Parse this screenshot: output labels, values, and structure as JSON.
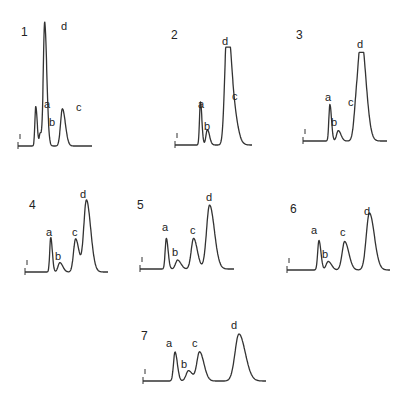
{
  "chart_data": [
    {
      "type": "line",
      "panel": "1",
      "peaks": [
        {
          "label": "a",
          "position": 0.24,
          "height": 0.32,
          "width": 0.012
        },
        {
          "label": "b",
          "position": 0.3,
          "height": 0.1,
          "width": 0.012
        },
        {
          "label": "d",
          "position": 0.36,
          "height": 1.0,
          "width": 0.018
        },
        {
          "label": "c",
          "position": 0.6,
          "height": 0.3,
          "width": 0.025
        }
      ],
      "x0": 18,
      "x1": 92,
      "baseline_y": 146,
      "top_y": 22,
      "number_pos": [
        21,
        36
      ],
      "label_pos": {
        "a": [
          44,
          108
        ],
        "b": [
          49,
          126
        ],
        "d": [
          61,
          30
        ],
        "c": [
          76,
          111
        ]
      }
    },
    {
      "type": "line",
      "panel": "2",
      "peaks": [
        {
          "label": "a",
          "position": 0.33,
          "height": 0.45,
          "width": 0.012
        },
        {
          "label": "b",
          "position": 0.42,
          "height": 0.16,
          "width": 0.018
        },
        {
          "label": "d",
          "position": 0.67,
          "height": 1.0,
          "width": 0.028
        },
        {
          "label": "c",
          "position": 0.73,
          "height": 0.5,
          "width": 0.04
        }
      ],
      "x0": 175,
      "x1": 252,
      "baseline_y": 145,
      "top_y": 49,
      "number_pos": [
        171,
        39
      ],
      "label_pos": {
        "a": [
          198,
          108
        ],
        "b": [
          204,
          130
        ],
        "d": [
          222,
          45
        ],
        "c": [
          232,
          100
        ]
      }
    },
    {
      "type": "line",
      "panel": "3",
      "peaks": [
        {
          "label": "a",
          "position": 0.32,
          "height": 0.42,
          "width": 0.012
        },
        {
          "label": "b",
          "position": 0.42,
          "height": 0.12,
          "width": 0.02
        },
        {
          "label": "c",
          "position": 0.64,
          "height": 0.45,
          "width": 0.03
        },
        {
          "label": "d",
          "position": 0.7,
          "height": 1.0,
          "width": 0.035
        }
      ],
      "x0": 303,
      "x1": 387,
      "baseline_y": 141,
      "top_y": 54,
      "number_pos": [
        296,
        39
      ],
      "label_pos": {
        "a": [
          325,
          101
        ],
        "b": [
          331,
          126
        ],
        "c": [
          348,
          106
        ],
        "d": [
          357,
          48
        ]
      }
    },
    {
      "type": "line",
      "panel": "4",
      "peaks": [
        {
          "label": "a",
          "position": 0.31,
          "height": 0.48,
          "width": 0.012
        },
        {
          "label": "b",
          "position": 0.42,
          "height": 0.13,
          "width": 0.022
        },
        {
          "label": "c",
          "position": 0.61,
          "height": 0.46,
          "width": 0.025
        },
        {
          "label": "d",
          "position": 0.74,
          "height": 1.0,
          "width": 0.032
        }
      ],
      "x0": 25,
      "x1": 108,
      "baseline_y": 272,
      "top_y": 200,
      "number_pos": [
        29,
        209
      ],
      "label_pos": {
        "a": [
          46,
          236
        ],
        "b": [
          55,
          260
        ],
        "c": [
          72,
          236
        ],
        "d": [
          80,
          198
        ]
      }
    },
    {
      "type": "line",
      "panel": "5",
      "peaks": [
        {
          "label": "a",
          "position": 0.28,
          "height": 0.48,
          "width": 0.012
        },
        {
          "label": "b",
          "position": 0.4,
          "height": 0.14,
          "width": 0.022
        },
        {
          "label": "c",
          "position": 0.57,
          "height": 0.48,
          "width": 0.025
        },
        {
          "label": "d",
          "position": 0.74,
          "height": 1.0,
          "width": 0.032
        }
      ],
      "x0": 140,
      "x1": 234,
      "baseline_y": 269,
      "top_y": 205,
      "number_pos": [
        137,
        209
      ],
      "label_pos": {
        "a": [
          162,
          231
        ],
        "b": [
          172,
          256
        ],
        "c": [
          190,
          234
        ],
        "d": [
          206,
          201
        ]
      }
    },
    {
      "type": "line",
      "panel": "6",
      "peaks": [
        {
          "label": "a",
          "position": 0.31,
          "height": 0.52,
          "width": 0.012
        },
        {
          "label": "b",
          "position": 0.4,
          "height": 0.15,
          "width": 0.02
        },
        {
          "label": "c",
          "position": 0.56,
          "height": 0.5,
          "width": 0.025
        },
        {
          "label": "d",
          "position": 0.8,
          "height": 1.0,
          "width": 0.03
        }
      ],
      "x0": 287,
      "x1": 390,
      "baseline_y": 270,
      "top_y": 213,
      "number_pos": [
        290,
        213
      ],
      "label_pos": {
        "a": [
          311,
          234
        ],
        "b": [
          322,
          258
        ],
        "c": [
          340,
          236
        ],
        "d": [
          364,
          215
        ]
      }
    },
    {
      "type": "line",
      "panel": "7",
      "peaks": [
        {
          "label": "a",
          "position": 0.26,
          "height": 0.62,
          "width": 0.012
        },
        {
          "label": "b",
          "position": 0.37,
          "height": 0.22,
          "width": 0.02
        },
        {
          "label": "c",
          "position": 0.46,
          "height": 0.62,
          "width": 0.022
        },
        {
          "label": "d",
          "position": 0.78,
          "height": 1.0,
          "width": 0.032
        }
      ],
      "x0": 143,
      "x1": 266,
      "baseline_y": 381,
      "top_y": 334,
      "number_pos": [
        141,
        340
      ],
      "label_pos": {
        "a": [
          166,
          347
        ],
        "b": [
          181,
          368
        ],
        "c": [
          192,
          347
        ],
        "d": [
          231,
          329
        ]
      }
    }
  ],
  "figure": {
    "panel_numbers": [
      "1",
      "2",
      "3",
      "4",
      "5",
      "6",
      "7"
    ],
    "peak_labels": [
      "a",
      "b",
      "c",
      "d"
    ],
    "colors": {
      "trace": "#333333",
      "background": "#ffffff"
    }
  }
}
